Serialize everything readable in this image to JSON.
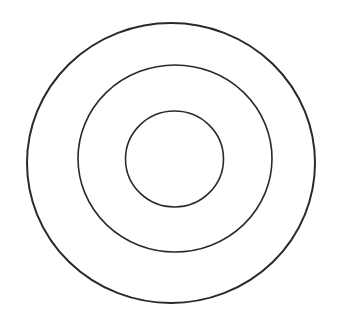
{
  "diagram": {
    "background": "#ffffff",
    "stroke_color": "#2a2a2a",
    "rings": [
      {
        "name": "outer-ring",
        "cx": 171,
        "cy": 163,
        "rx": 144,
        "ry": 140,
        "stroke_width": 2
      },
      {
        "name": "middle-ring",
        "cx": 175,
        "cy": 158.5,
        "rx": 97,
        "ry": 93.5,
        "stroke_width": 1.6
      },
      {
        "name": "inner-ring",
        "cx": 174.5,
        "cy": 159,
        "rx": 49,
        "ry": 48,
        "stroke_width": 1.6
      }
    ]
  }
}
